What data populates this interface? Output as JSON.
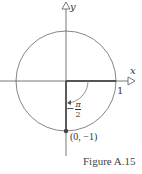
{
  "figure": {
    "caption": "Figure A.15",
    "axes": {
      "x_label": "x",
      "y_label": "y"
    },
    "circle": {
      "type": "unit circle",
      "radius_label": "1"
    },
    "angle": {
      "sign": "−",
      "numerator": "π",
      "denominator": "2"
    },
    "point": {
      "label": "(0, −1)"
    },
    "colors": {
      "stroke": "#555555",
      "highlight": "#333333",
      "arc": "#777777"
    }
  }
}
